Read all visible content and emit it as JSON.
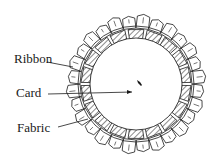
{
  "diagram": {
    "labels": {
      "ribbon": "Ribbon",
      "card": "Card",
      "fabric": "Fabric"
    },
    "colors": {
      "ink": "#1a1a1a",
      "background": "#ffffff"
    }
  }
}
